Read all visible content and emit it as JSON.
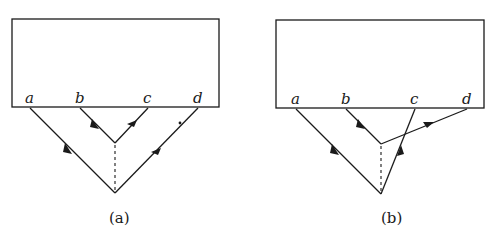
{
  "figure": {
    "panels": [
      {
        "id": "a",
        "caption": "(a)",
        "caption_letter": "a",
        "box": {
          "x": 12,
          "y": 19,
          "w": 207,
          "h": 88
        },
        "points": {
          "a": {
            "label": "a",
            "x": 30,
            "y": 107
          },
          "b": {
            "label": "b",
            "x": 80,
            "y": 107
          },
          "c": {
            "label": "c",
            "x": 148,
            "y": 107
          },
          "d": {
            "label": "d",
            "x": 198,
            "y": 107
          }
        },
        "inner_vertex": {
          "x": 115,
          "y": 143
        },
        "outer_vertex": {
          "x": 115,
          "y": 193
        },
        "description": "Lines b→inner vertex→c and a→outer vertex→d, with a dashed line connecting the two vertices; a small dot near line to d."
      },
      {
        "id": "b",
        "caption": "(b)",
        "caption_letter": "b",
        "box": {
          "x": 276,
          "y": 20,
          "w": 208,
          "h": 88
        },
        "points": {
          "a": {
            "label": "a",
            "x": 296,
            "y": 108
          },
          "b": {
            "label": "b",
            "x": 346,
            "y": 108
          },
          "c": {
            "label": "c",
            "x": 415,
            "y": 108
          },
          "d": {
            "label": "d",
            "x": 467,
            "y": 108
          }
        },
        "inner_vertex": {
          "x": 381,
          "y": 144
        },
        "outer_vertex": {
          "x": 381,
          "y": 194
        },
        "description": "Crossed configuration: b→inner vertex→d and a→outer vertex→c, lines crossing, with a dashed line connecting the two vertices."
      }
    ]
  }
}
